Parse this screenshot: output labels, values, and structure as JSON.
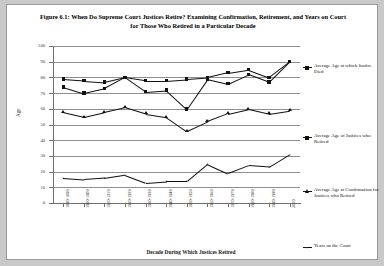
{
  "figure": {
    "title": "Figure 6.1: When Do Supreme Court Justices Retire? Examining Confirmation, Retirement, and Years on Court for Those Who Retired in a Particular Decade"
  },
  "legend": {
    "position": "right",
    "entries": [
      {
        "label": "Average Age at which Justice Died",
        "marker": "square"
      },
      {
        "label": "Average Age of Justices who Retired",
        "marker": "square"
      },
      {
        "label": "Average Age at Confirmation for Justices who Retired",
        "marker": "triangle"
      },
      {
        "label": "Years on the Court",
        "marker": "cross"
      }
    ]
  },
  "chart_data": {
    "type": "line",
    "title": "Figure 6.1: When Do Supreme Court Justices Retire? Examining Confirmation, Retirement, and Years on Court for Those Who Retired in a Particular Decade",
    "xlabel": "Decade During Which Justices Retired",
    "ylabel": "Age",
    "ylim": [
      0,
      100
    ],
    "ytick_step": 10,
    "yticks": [
      0,
      10,
      20,
      30,
      40,
      50,
      60,
      70,
      80,
      90,
      100
    ],
    "grid": true,
    "legend_position": "right",
    "categories": [
      "1890-1899",
      "1900-1909",
      "1910-1919",
      "1920-1929",
      "1930-1939",
      "1940-1949",
      "1950-1959",
      "1960-1969",
      "1970-1979",
      "1980-1989",
      "1990-1999",
      "2010"
    ],
    "series": [
      {
        "name": "Average Age at which Justice Died",
        "marker": "square",
        "values": [
          79,
          78,
          77,
          80,
          78,
          78,
          79,
          80,
          83,
          85,
          80,
          90
        ]
      },
      {
        "name": "Average Age of Justices who Retired",
        "marker": "square",
        "values": [
          74,
          70,
          73,
          80,
          71,
          72,
          60,
          79,
          76,
          82,
          77,
          90
        ]
      },
      {
        "name": "Average Age at Confirmation for Justices who Retired",
        "marker": "triangle",
        "values": [
          58,
          55,
          58,
          61,
          57,
          55,
          46,
          52,
          57,
          60,
          57,
          59
        ]
      },
      {
        "name": "Years on the Court",
        "marker": "cross",
        "values": [
          16,
          15,
          16,
          18,
          13,
          14,
          14,
          25,
          19,
          24,
          23,
          31
        ]
      }
    ]
  },
  "axes": {
    "ytick_labels": [
      "100",
      "90",
      "80",
      "70",
      "60",
      "50",
      "40",
      "30",
      "20",
      "10",
      "0"
    ]
  }
}
